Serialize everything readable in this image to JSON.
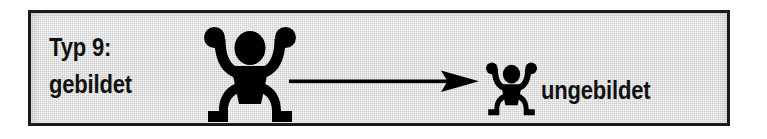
{
  "panel": {
    "border_color": "#1a1a1a",
    "fill_color": "#d2d2d2"
  },
  "type_label": {
    "line1": "Typ 9:",
    "line2": "gebildet"
  },
  "right_label": {
    "text": "ungebildet"
  },
  "figures": {
    "large": {
      "icon": "person-arms-raised-icon",
      "color": "#000000"
    },
    "small": {
      "icon": "person-arms-raised-icon",
      "color": "#000000"
    }
  },
  "arrow": {
    "icon": "arrow-right-icon",
    "direction": "right",
    "color": "#000000"
  }
}
